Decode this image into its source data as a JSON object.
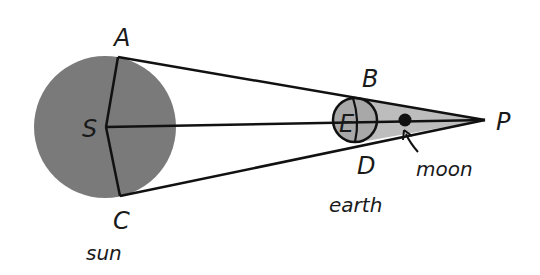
{
  "diagram": {
    "points": {
      "A": "A",
      "B": "B",
      "C": "C",
      "D": "D",
      "E": "E",
      "S": "S",
      "P": "P"
    },
    "captions": {
      "sun": "sun",
      "earth": "earth",
      "moon": "moon"
    },
    "colors": {
      "sun_fill": "#7a7a7a",
      "earth_fill": "#a8a8a8",
      "shadow_fill": "#bdbdbd",
      "line": "#111111",
      "moon_fill": "#111111",
      "background": "#ffffff"
    }
  }
}
